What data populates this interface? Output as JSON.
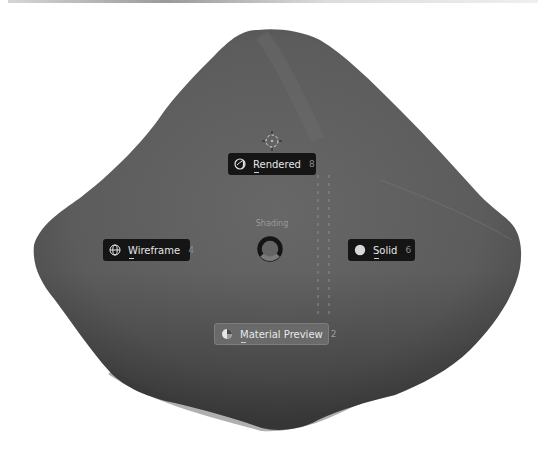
{
  "viewport": {
    "object": "rock-mesh",
    "colors": {
      "background": "#ffffff",
      "mesh": "#5e5e5e",
      "button_bg": "#151515",
      "button_active_bg": "#6a6a6a",
      "text": "#e6e6e6",
      "shortcut_text": "#8a8a8a"
    }
  },
  "pie_menu": {
    "title": "Shading",
    "items": [
      {
        "id": "rendered",
        "label": "Rendered",
        "shortcut": "8",
        "icon": "rendered-shading-icon",
        "position": "top",
        "active": false
      },
      {
        "id": "wireframe",
        "label": "Wireframe",
        "shortcut": "4",
        "icon": "wireframe-shading-icon",
        "position": "left",
        "active": false
      },
      {
        "id": "solid",
        "label": "Solid",
        "shortcut": "6",
        "icon": "solid-shading-icon",
        "position": "right",
        "active": false
      },
      {
        "id": "material_preview",
        "label": "Material Preview",
        "shortcut": "2",
        "icon": "material-preview-shading-icon",
        "position": "bottom",
        "active": true
      }
    ]
  }
}
